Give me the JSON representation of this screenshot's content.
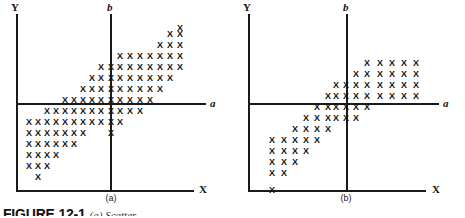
{
  "figure": {
    "caption_number": "FIGURE 12-1",
    "caption_text": "(a) Scatter",
    "background_color": "#ffffff",
    "ink_color": "#1a1a1a"
  },
  "panels": [
    {
      "id": "a",
      "sub_caption": "(a)",
      "axes": {
        "y_label": "Y",
        "x_label": "X",
        "a_label": "a",
        "b_label": "b"
      }
    },
    {
      "id": "b",
      "sub_caption": "(b)",
      "axes": {
        "y_label": "Y",
        "x_label": "X",
        "a_label": "a",
        "b_label": "b"
      }
    }
  ],
  "chart_data": [
    {
      "type": "scatter",
      "title": "(a)",
      "xlabel": "X",
      "ylabel": "Y",
      "marker": "x",
      "grid": false,
      "legend": null,
      "reference_lines": [
        {
          "name": "a",
          "orientation": "horizontal",
          "label": "a"
        },
        {
          "name": "b",
          "orientation": "vertical",
          "label": "b"
        }
      ],
      "axis_pixel_geometry": {
        "y_axis_x": 16,
        "x_axis_y": 190,
        "a_axis_y": 103,
        "b_axis_x": 111,
        "plot_right": 205
      },
      "points": [
        [
          29,
          122
        ],
        [
          29,
          133
        ],
        [
          29,
          144
        ],
        [
          29,
          155
        ],
        [
          29,
          166
        ],
        [
          38,
          122
        ],
        [
          38,
          133
        ],
        [
          38,
          144
        ],
        [
          38,
          155
        ],
        [
          38,
          166
        ],
        [
          38,
          177
        ],
        [
          47,
          111
        ],
        [
          47,
          122
        ],
        [
          47,
          133
        ],
        [
          47,
          144
        ],
        [
          47,
          155
        ],
        [
          47,
          166
        ],
        [
          56,
          111
        ],
        [
          56,
          122
        ],
        [
          56,
          133
        ],
        [
          56,
          144
        ],
        [
          56,
          155
        ],
        [
          65,
          100
        ],
        [
          65,
          111
        ],
        [
          65,
          122
        ],
        [
          65,
          133
        ],
        [
          65,
          144
        ],
        [
          74,
          100
        ],
        [
          74,
          111
        ],
        [
          74,
          122
        ],
        [
          74,
          133
        ],
        [
          74,
          144
        ],
        [
          83,
          89
        ],
        [
          83,
          100
        ],
        [
          83,
          111
        ],
        [
          83,
          122
        ],
        [
          83,
          133
        ],
        [
          92,
          78
        ],
        [
          92,
          89
        ],
        [
          92,
          100
        ],
        [
          92,
          111
        ],
        [
          92,
          122
        ],
        [
          101,
          67
        ],
        [
          101,
          78
        ],
        [
          101,
          89
        ],
        [
          101,
          100
        ],
        [
          101,
          111
        ],
        [
          101,
          122
        ],
        [
          111,
          67
        ],
        [
          111,
          78
        ],
        [
          111,
          89
        ],
        [
          111,
          100
        ],
        [
          111,
          111
        ],
        [
          111,
          122
        ],
        [
          111,
          133
        ],
        [
          120,
          56
        ],
        [
          120,
          67
        ],
        [
          120,
          78
        ],
        [
          120,
          89
        ],
        [
          120,
          100
        ],
        [
          120,
          111
        ],
        [
          120,
          122
        ],
        [
          130,
          56
        ],
        [
          130,
          67
        ],
        [
          130,
          78
        ],
        [
          130,
          89
        ],
        [
          130,
          100
        ],
        [
          130,
          111
        ],
        [
          140,
          56
        ],
        [
          140,
          67
        ],
        [
          140,
          78
        ],
        [
          140,
          89
        ],
        [
          140,
          100
        ],
        [
          140,
          111
        ],
        [
          150,
          56
        ],
        [
          150,
          67
        ],
        [
          150,
          78
        ],
        [
          150,
          89
        ],
        [
          150,
          100
        ],
        [
          160,
          45
        ],
        [
          160,
          56
        ],
        [
          160,
          67
        ],
        [
          160,
          78
        ],
        [
          160,
          89
        ],
        [
          170,
          34
        ],
        [
          170,
          45
        ],
        [
          170,
          56
        ],
        [
          170,
          67
        ],
        [
          170,
          78
        ],
        [
          180,
          28
        ],
        [
          180,
          34
        ],
        [
          180,
          45
        ],
        [
          180,
          56
        ],
        [
          180,
          67
        ]
      ]
    },
    {
      "type": "scatter",
      "title": "(b)",
      "xlabel": "X",
      "ylabel": "Y",
      "marker": "x",
      "grid": false,
      "legend": null,
      "reference_lines": [
        {
          "name": "a",
          "orientation": "horizontal",
          "label": "a"
        },
        {
          "name": "b",
          "orientation": "vertical",
          "label": "b"
        }
      ],
      "axis_pixel_geometry": {
        "y_axis_x": 16,
        "x_axis_y": 190,
        "a_axis_y": 103,
        "b_axis_x": 114,
        "plot_right": 205
      },
      "points": [
        [
          40,
          140
        ],
        [
          40,
          151
        ],
        [
          40,
          162
        ],
        [
          40,
          173
        ],
        [
          40,
          190
        ],
        [
          52,
          140
        ],
        [
          52,
          151
        ],
        [
          52,
          162
        ],
        [
          52,
          173
        ],
        [
          63,
          129
        ],
        [
          63,
          140
        ],
        [
          63,
          151
        ],
        [
          63,
          162
        ],
        [
          74,
          118
        ],
        [
          74,
          129
        ],
        [
          74,
          140
        ],
        [
          74,
          151
        ],
        [
          85,
          107
        ],
        [
          85,
          118
        ],
        [
          85,
          129
        ],
        [
          85,
          140
        ],
        [
          96,
          96
        ],
        [
          96,
          107
        ],
        [
          96,
          118
        ],
        [
          96,
          129
        ],
        [
          104,
          85
        ],
        [
          104,
          96
        ],
        [
          104,
          107
        ],
        [
          104,
          118
        ],
        [
          114,
          85
        ],
        [
          114,
          96
        ],
        [
          114,
          107
        ],
        [
          114,
          118
        ],
        [
          124,
          74
        ],
        [
          124,
          85
        ],
        [
          124,
          96
        ],
        [
          124,
          107
        ],
        [
          124,
          118
        ],
        [
          135,
          63
        ],
        [
          135,
          74
        ],
        [
          135,
          85
        ],
        [
          135,
          96
        ],
        [
          135,
          107
        ],
        [
          148,
          63
        ],
        [
          148,
          74
        ],
        [
          148,
          85
        ],
        [
          148,
          96
        ],
        [
          160,
          63
        ],
        [
          160,
          74
        ],
        [
          160,
          85
        ],
        [
          160,
          96
        ],
        [
          172,
          63
        ],
        [
          172,
          74
        ],
        [
          172,
          85
        ],
        [
          172,
          96
        ],
        [
          184,
          63
        ],
        [
          184,
          74
        ],
        [
          184,
          85
        ],
        [
          184,
          96
        ]
      ]
    }
  ]
}
